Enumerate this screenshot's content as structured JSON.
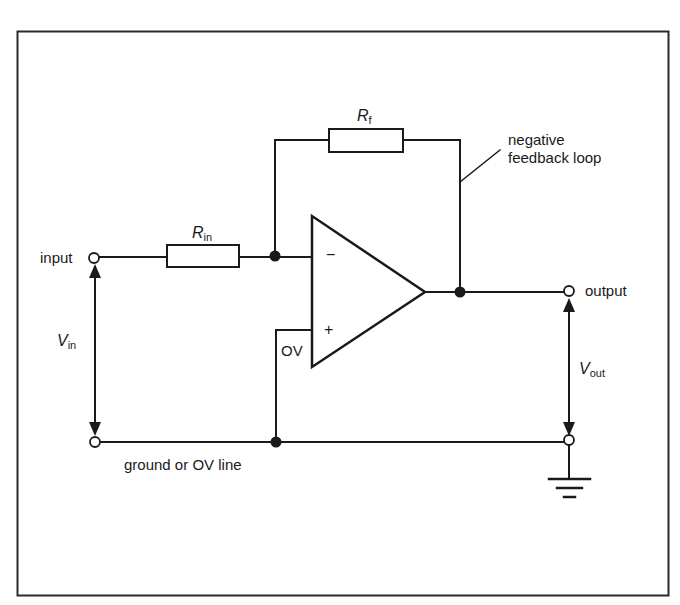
{
  "diagram": {
    "type": "circuit-schematic",
    "colors": {
      "line": "#1a1a1a",
      "background": "#ffffff",
      "frame": "#2a2a2a"
    },
    "labels": {
      "input": "input",
      "output": "output",
      "ground_line": "ground or OV line",
      "feedback": "negative\nfeedback loop",
      "feedback_line1": "negative",
      "feedback_line2": "feedback loop",
      "zero_volt": "OV",
      "inverting": "−",
      "non_inverting": "+"
    },
    "components": {
      "rf": {
        "symbol": "R",
        "subscript": "f"
      },
      "rin": {
        "symbol": "R",
        "subscript": "in"
      },
      "vin": {
        "symbol": "V",
        "subscript": "in"
      },
      "vout": {
        "symbol": "V",
        "subscript": "out"
      }
    },
    "nodes": [
      {
        "id": "input-terminal",
        "kind": "open-terminal"
      },
      {
        "id": "ground-left-terminal",
        "kind": "open-terminal"
      },
      {
        "id": "output-terminal",
        "kind": "open-terminal"
      },
      {
        "id": "ground-right-terminal",
        "kind": "open-terminal"
      },
      {
        "id": "inverting-junction",
        "kind": "junction"
      },
      {
        "id": "output-junction",
        "kind": "junction"
      },
      {
        "id": "ground-junction",
        "kind": "junction"
      }
    ]
  }
}
